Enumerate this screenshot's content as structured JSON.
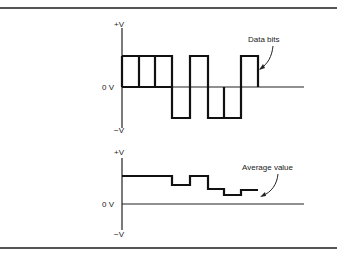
{
  "figure": {
    "top_graph": {
      "y_top_label": "+V",
      "y_zero_label": "0 V",
      "y_bottom_label": "−V",
      "annotation": "Data bits",
      "bit_levels": [
        1,
        1,
        1,
        -1,
        1,
        -1,
        -1,
        1
      ]
    },
    "bottom_graph": {
      "y_top_label": "+V",
      "y_zero_label": "0 V",
      "y_bottom_label": "−V",
      "annotation": "Average value",
      "average_levels": [
        1,
        1,
        1,
        0.7,
        1,
        0.55,
        0.3,
        0.45
      ]
    }
  },
  "colors": {
    "stroke": "#111111",
    "rule": "#555555",
    "background": "#ffffff"
  }
}
